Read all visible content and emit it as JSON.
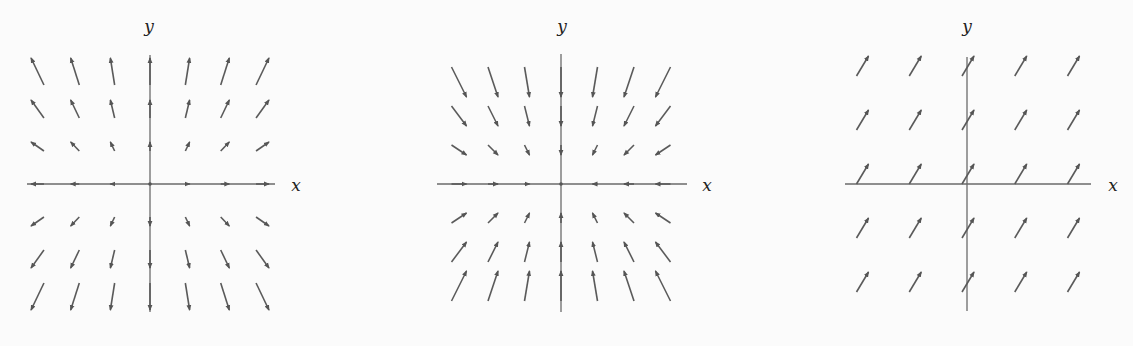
{
  "plots": [
    {
      "name": "vector-field-source",
      "description": "Radially outward (source) vector field",
      "origin_px": [
        150,
        184
      ],
      "grid_spacing_px": [
        37.5,
        37.5
      ],
      "x_axis_px": [
        27,
        275
      ],
      "y_axis_px": [
        55,
        312
      ],
      "x_label": "x",
      "y_label": "y",
      "x_label_pos": [
        296,
        191
      ],
      "y_label_pos": [
        149,
        32
      ],
      "grid": {
        "i": [
          -3,
          -2,
          -1,
          0,
          1,
          2,
          3
        ],
        "j": [
          -3,
          -2,
          -1,
          0,
          1,
          2,
          3
        ]
      },
      "field_px": {
        "kx": 4.3,
        "ky": 9.0,
        "type": "linear"
      },
      "arrow_anchor": "center"
    },
    {
      "name": "vector-field-sink",
      "description": "Radially inward (sink) vector field",
      "origin_px": [
        561,
        184
      ],
      "grid_spacing_px": [
        34,
        34
      ],
      "x_axis_px": [
        437,
        687
      ],
      "y_axis_px": [
        54,
        312
      ],
      "x_label": "x",
      "y_label": "y",
      "x_label_pos": [
        707,
        191
      ],
      "y_label_pos": [
        562,
        32
      ],
      "grid": {
        "i": [
          -3,
          -2,
          -1,
          0,
          1,
          2,
          3
        ],
        "j": [
          -3,
          -2,
          -1,
          0,
          1,
          2,
          3
        ]
      },
      "field_px": {
        "kx": -5.0,
        "ky": -10.0,
        "type": "linear"
      },
      "arrow_anchor": "center"
    },
    {
      "name": "vector-field-constant",
      "description": "Constant vector field",
      "origin_px": [
        967,
        184
      ],
      "grid_spacing_px": [
        52.75,
        54
      ],
      "x_axis_px": [
        845,
        1091
      ],
      "y_axis_px": [
        57,
        311
      ],
      "x_label": "x",
      "y_label": "y",
      "x_label_pos": [
        1113,
        191
      ],
      "y_label_pos": [
        967,
        32
      ],
      "grid": {
        "i": [
          -2,
          -1,
          0,
          1,
          2
        ],
        "j": [
          -2,
          -1,
          0,
          1,
          2
        ]
      },
      "field_px": {
        "vx": 12,
        "vy": 20,
        "type": "constant"
      },
      "arrow_anchor": "tail_offset",
      "tail_offset_px": [
        -5,
        0
      ]
    }
  ],
  "style": {
    "arrow_color": "#5a5a5a",
    "axis_color": "#6a6a6a",
    "background": "#fbfbfb"
  }
}
